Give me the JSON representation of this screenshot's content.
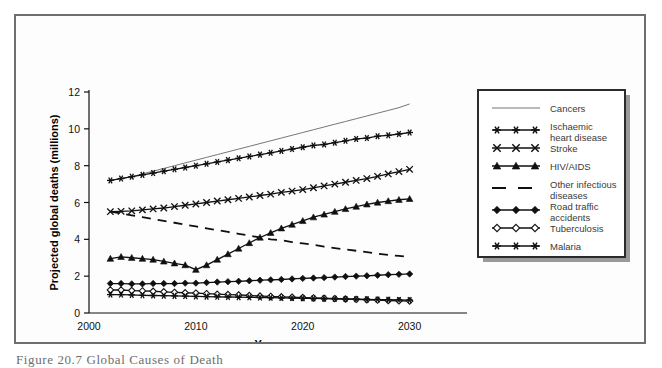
{
  "figure": {
    "caption": "Figure 20.7  Global Causes of Death",
    "frame_color": "#6e6e6e",
    "background": "#fdfdfd"
  },
  "chart_data": {
    "type": "line",
    "title": "",
    "xlabel": "Year",
    "ylabel": "Projected global deaths (millions)",
    "xlim": [
      2000,
      2032
    ],
    "ylim": [
      0,
      12
    ],
    "xticks": [
      2000,
      2010,
      2020,
      2030
    ],
    "yticks": [
      0,
      2,
      4,
      6,
      8,
      10,
      12
    ],
    "grid": false,
    "legend_position": "right",
    "x": [
      2002,
      2003,
      2004,
      2005,
      2006,
      2007,
      2008,
      2009,
      2010,
      2011,
      2012,
      2013,
      2014,
      2015,
      2016,
      2017,
      2018,
      2019,
      2020,
      2021,
      2022,
      2023,
      2024,
      2025,
      2026,
      2027,
      2028,
      2029,
      2030
    ],
    "series": [
      {
        "name": "Cancers",
        "marker": "none",
        "line": "solid-thin",
        "color": "#767676",
        "values": [
          7.2,
          7.3,
          7.4,
          7.55,
          7.7,
          7.85,
          8.0,
          8.15,
          8.3,
          8.45,
          8.6,
          8.75,
          8.9,
          9.05,
          9.2,
          9.35,
          9.5,
          9.65,
          9.8,
          9.95,
          10.1,
          10.25,
          10.4,
          10.55,
          10.7,
          10.85,
          11.0,
          11.15,
          11.35
        ]
      },
      {
        "name": "Ischaemic heart disease",
        "marker": "asterisk",
        "line": "solid",
        "color": "#101010",
        "values": [
          7.2,
          7.3,
          7.4,
          7.5,
          7.6,
          7.7,
          7.8,
          7.9,
          8.0,
          8.1,
          8.2,
          8.3,
          8.4,
          8.5,
          8.6,
          8.7,
          8.8,
          8.9,
          9.0,
          9.1,
          9.15,
          9.25,
          9.35,
          9.45,
          9.5,
          9.6,
          9.65,
          9.72,
          9.8
        ]
      },
      {
        "name": "Stroke",
        "marker": "x",
        "line": "solid",
        "color": "#101010",
        "values": [
          5.5,
          5.52,
          5.55,
          5.6,
          5.65,
          5.7,
          5.78,
          5.85,
          5.92,
          6.0,
          6.08,
          6.15,
          6.22,
          6.3,
          6.38,
          6.45,
          6.55,
          6.62,
          6.7,
          6.8,
          6.9,
          7.0,
          7.1,
          7.2,
          7.3,
          7.42,
          7.55,
          7.68,
          7.8
        ]
      },
      {
        "name": "HIV/AIDS",
        "marker": "triangle",
        "line": "solid",
        "color": "#101010",
        "values": [
          2.95,
          3.05,
          3.0,
          2.95,
          2.9,
          2.8,
          2.7,
          2.6,
          2.35,
          2.6,
          2.9,
          3.2,
          3.5,
          3.8,
          4.1,
          4.35,
          4.6,
          4.8,
          5.0,
          5.2,
          5.35,
          5.5,
          5.65,
          5.78,
          5.9,
          6.0,
          6.08,
          6.15,
          6.2
        ]
      },
      {
        "name": "Other infectious diseases",
        "marker": "none",
        "line": "dashed",
        "color": "#101010",
        "values": [
          5.5,
          5.4,
          5.3,
          5.2,
          5.1,
          5.0,
          4.9,
          4.8,
          4.7,
          4.6,
          4.5,
          4.4,
          4.3,
          4.2,
          4.1,
          4.0,
          3.95,
          3.85,
          3.78,
          3.7,
          3.6,
          3.52,
          3.45,
          3.38,
          3.3,
          3.22,
          3.15,
          3.1,
          3.05
        ]
      },
      {
        "name": "Road traffic accidents",
        "marker": "diamond-filled",
        "line": "solid",
        "color": "#101010",
        "values": [
          1.6,
          1.6,
          1.58,
          1.58,
          1.6,
          1.6,
          1.6,
          1.62,
          1.62,
          1.65,
          1.68,
          1.7,
          1.72,
          1.75,
          1.78,
          1.8,
          1.82,
          1.85,
          1.88,
          1.9,
          1.92,
          1.95,
          1.98,
          2.0,
          2.02,
          2.05,
          2.08,
          2.1,
          2.12
        ]
      },
      {
        "name": "Tuberculosis",
        "marker": "diamond-open",
        "line": "solid",
        "color": "#101010",
        "values": [
          1.25,
          1.25,
          1.22,
          1.2,
          1.18,
          1.15,
          1.12,
          1.1,
          1.08,
          1.05,
          1.02,
          1.0,
          0.98,
          0.95,
          0.92,
          0.9,
          0.88,
          0.86,
          0.84,
          0.82,
          0.8,
          0.78,
          0.76,
          0.74,
          0.72,
          0.7,
          0.68,
          0.66,
          0.65
        ]
      },
      {
        "name": "Malaria",
        "marker": "asterisk",
        "line": "solid",
        "color": "#101010",
        "values": [
          1.0,
          1.0,
          0.98,
          0.96,
          0.95,
          0.94,
          0.93,
          0.92,
          0.9,
          0.89,
          0.88,
          0.87,
          0.86,
          0.85,
          0.84,
          0.83,
          0.82,
          0.81,
          0.8,
          0.79,
          0.78,
          0.77,
          0.76,
          0.75,
          0.74,
          0.73,
          0.72,
          0.71,
          0.7
        ]
      }
    ]
  },
  "legend": {
    "entries": [
      {
        "label": "Cancers",
        "marker": "none",
        "line": "solid-thin"
      },
      {
        "label": "Ischaemic\nheart disease",
        "marker": "asterisk",
        "line": "solid"
      },
      {
        "label": "Stroke",
        "marker": "x",
        "line": "solid"
      },
      {
        "label": "HIV/AIDS",
        "marker": "triangle",
        "line": "solid"
      },
      {
        "label": "Other infectious\ndiseases",
        "marker": "none",
        "line": "dashed"
      },
      {
        "label": "Road traffic\naccidents",
        "marker": "diamond-filled",
        "line": "solid"
      },
      {
        "label": "Tuberculosis",
        "marker": "diamond-open",
        "line": "solid"
      },
      {
        "label": "Malaria",
        "marker": "asterisk",
        "line": "solid"
      }
    ]
  }
}
